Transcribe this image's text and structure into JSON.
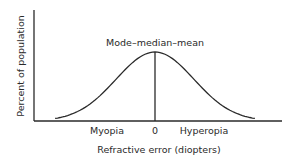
{
  "title": "Mode–median–mean",
  "y_axis_label": "Percent of population",
  "x_axis_label": "Refractive error (diopters)",
  "x_labels": {
    "left": "Myopia",
    "center": "0",
    "right": "Hyperopia"
  },
  "colors": {
    "line": "#2a2a2a",
    "background": "#ffffff"
  },
  "chart_data": {
    "type": "line",
    "title": "",
    "annotation": "Mode–median–mean",
    "xlabel": "Refractive error (diopters)",
    "ylabel": "Percent of population",
    "x_tick_labels": [
      "Myopia",
      "0",
      "Hyperopia"
    ],
    "xlim": [
      -3,
      3
    ],
    "ylim": [
      0,
      1.2
    ],
    "grid": false,
    "series": [
      {
        "name": "Population distribution",
        "x": [
          -2.7,
          -2.4,
          -2.1,
          -1.8,
          -1.5,
          -1.2,
          -0.9,
          -0.6,
          -0.3,
          0,
          0.3,
          0.6,
          0.9,
          1.2,
          1.5,
          1.8,
          2.1,
          2.4,
          2.7
        ],
        "y": [
          0.03,
          0.06,
          0.11,
          0.2,
          0.32,
          0.49,
          0.67,
          0.84,
          0.96,
          1.0,
          0.96,
          0.84,
          0.67,
          0.49,
          0.32,
          0.2,
          0.11,
          0.06,
          0.03
        ]
      }
    ],
    "reference_line": {
      "x": 0,
      "label": "Mode–median–mean"
    }
  }
}
